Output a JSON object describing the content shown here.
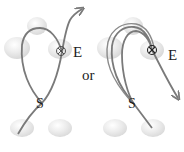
{
  "diagram": {
    "separator_label": "or",
    "panels": [
      {
        "id": "left",
        "start_label": "S",
        "end_label": "E",
        "path_description": "single loop, exits upward",
        "arrow_direction": "up-right"
      },
      {
        "id": "right",
        "start_label": "S",
        "end_label": "E",
        "path_description": "double loop, exits downward",
        "arrow_direction": "down-right"
      }
    ],
    "colors": {
      "path": "#7a7a7a",
      "sphere_fill": "#e6e6e6",
      "sphere_edge": "#cfcfcf",
      "text": "#222222"
    }
  }
}
